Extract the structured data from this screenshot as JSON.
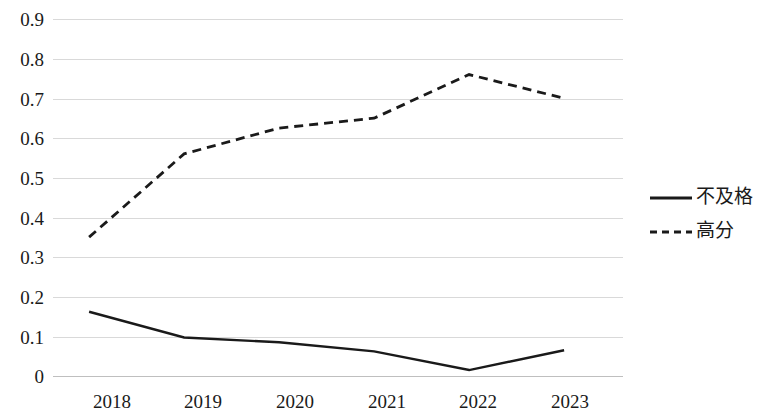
{
  "chart_data": {
    "type": "line",
    "title": "",
    "subtitle": "",
    "xlabel": "",
    "ylabel": "",
    "categories": [
      "2018",
      "2019",
      "2020",
      "2021",
      "2022",
      "2023"
    ],
    "series": [
      {
        "name": "不及格",
        "style": "solid",
        "color": "#1a1a1a",
        "values": [
          0.162,
          0.097,
          0.085,
          0.062,
          0.015,
          0.065
        ]
      },
      {
        "name": "高分",
        "style": "dashed",
        "color": "#1a1a1a",
        "values": [
          0.35,
          0.56,
          0.625,
          0.65,
          0.76,
          0.7
        ]
      }
    ],
    "ylim": [
      0,
      0.9
    ],
    "ytick_step": 0.1,
    "ytick_labels": [
      "0.9",
      "0.8",
      "0.7",
      "0.6",
      "0.5",
      "0.4",
      "0.3",
      "0.2",
      "0.1",
      "0"
    ],
    "ytick_values": [
      0.9,
      0.8,
      0.7,
      0.6,
      0.5,
      0.4,
      0.3,
      0.2,
      0.1,
      0
    ],
    "grid": true,
    "grid_axis": "y",
    "grid_color": "#d9d9d9",
    "legend_position": "right",
    "legend": [
      {
        "label": "不及格",
        "style": "solid"
      },
      {
        "label": "高分",
        "style": "dashed"
      }
    ],
    "plot_area": {
      "left": 53,
      "right": 623,
      "top": 19,
      "bottom": 376
    }
  }
}
